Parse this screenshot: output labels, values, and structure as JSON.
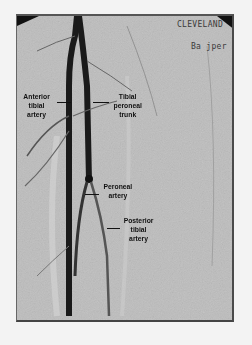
{
  "image": {
    "description": "Digital subtraction angiogram of lower leg showing tibial arteries",
    "background_color": "#bdbdbd",
    "vessel_color": "#1a1a1a"
  },
  "overlay": {
    "institution": "CLEVELAND",
    "patient": "Ba jper"
  },
  "labels": [
    {
      "id": "anterior-tibial",
      "text": "Anterior\ntibial\nartery"
    },
    {
      "id": "tibial-peroneal-trunk",
      "text": "Tibial\nperoneal\ntrunk"
    },
    {
      "id": "peroneal",
      "text": "Peroneal\nartery"
    },
    {
      "id": "posterior-tibial",
      "text": "Posterior\ntibial\nartery"
    }
  ]
}
